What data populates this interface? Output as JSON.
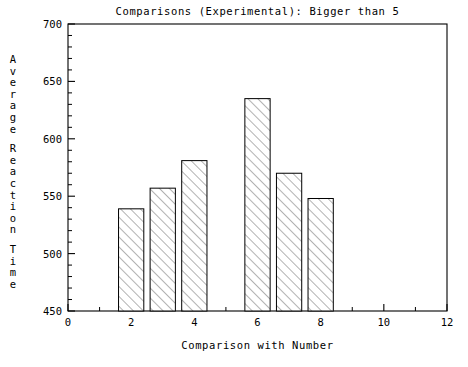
{
  "chart_data": {
    "type": "bar",
    "title": "Comparisons (Experimental): Bigger than 5",
    "xlabel": "Comparison with Number",
    "ylabel": "Average Reaction Time",
    "ylabel_words": [
      "Average",
      "Reaction",
      "Time"
    ],
    "categories": [
      2,
      3,
      4,
      6,
      7,
      8
    ],
    "values": [
      539,
      557,
      581,
      635,
      570,
      548
    ],
    "xlim": [
      0,
      12
    ],
    "ylim": [
      450,
      700
    ],
    "x_major_ticks": [
      0,
      2,
      4,
      6,
      8,
      10,
      12
    ],
    "x_minor_ticks": [
      1,
      3,
      5,
      7,
      9,
      11
    ],
    "y_major_ticks": [
      450,
      500,
      550,
      600,
      650,
      700
    ],
    "y_minor_step": 10,
    "x_tick_labels": [
      "0",
      "2",
      "4",
      "6",
      "8",
      "10",
      "12"
    ],
    "y_tick_labels": [
      "450",
      "500",
      "550",
      "600",
      "650",
      "700"
    ],
    "bar_width_units": 0.8,
    "grid": false,
    "legend": false,
    "bar_fill": "hatch-45",
    "bar_stroke": "#000000",
    "background": "#ffffff"
  }
}
